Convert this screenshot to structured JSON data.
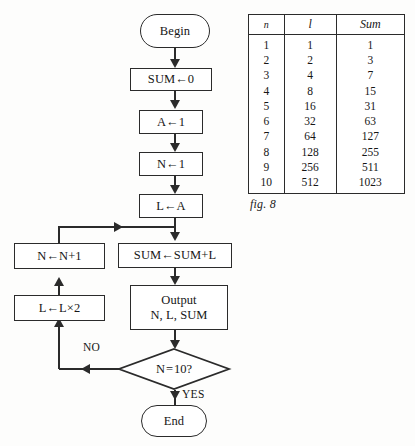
{
  "figure": {
    "caption": "fig. 8"
  },
  "flowchart": {
    "begin": "Begin",
    "sum_init": "SUM←0",
    "a_init": "A←1",
    "n_init": "N←1",
    "l_assign": "L←A",
    "n_increment": "N←N+1",
    "l_double": "L←L×2",
    "sum_update": "SUM←SUM+L",
    "output": "Output\nN, L, SUM",
    "decision": "N = 10?",
    "label_no": "NO",
    "label_yes": "YES",
    "end": "End"
  },
  "table": {
    "headers": [
      "n",
      "l",
      "Sum"
    ],
    "rows": [
      [
        "1",
        "1",
        "1"
      ],
      [
        "2",
        "2",
        "3"
      ],
      [
        "3",
        "4",
        "7"
      ],
      [
        "4",
        "8",
        "15"
      ],
      [
        "5",
        "16",
        "31"
      ],
      [
        "6",
        "32",
        "63"
      ],
      [
        "7",
        "64",
        "127"
      ],
      [
        "8",
        "128",
        "255"
      ],
      [
        "9",
        "256",
        "511"
      ],
      [
        "10",
        "512",
        "1023"
      ]
    ]
  },
  "colors": {
    "stroke": "#2b2b2b",
    "text": "#161616",
    "background": "#fdfdfc"
  }
}
